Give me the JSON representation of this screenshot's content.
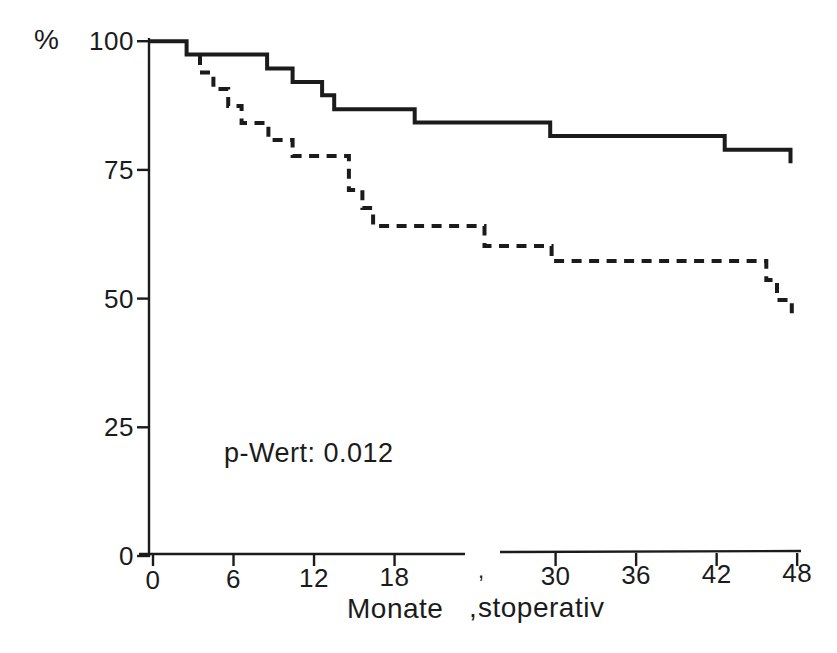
{
  "figure": {
    "background": "#ffffff",
    "ink_color": "#1b1b1b"
  },
  "labels": {
    "y_unit": "%",
    "p_value_annotation": "p-Wert: 0.012",
    "xlabel_part1": "Monate",
    "xlabel_part2": "stoperativ",
    "comma_artifact": ","
  },
  "chart_data": {
    "type": "line",
    "subtype": "kaplan-meier-step-curves",
    "title": "",
    "xlabel": "Monate ,stoperativ",
    "ylabel": "%",
    "annotation": "p-Wert: 0.012",
    "xlim": [
      0,
      48
    ],
    "ylim": [
      0,
      100
    ],
    "grid": false,
    "legend": "none",
    "x_ticks_months": [
      0,
      6,
      12,
      18,
      30,
      36,
      42,
      48
    ],
    "x_ticks_labels": [
      "0",
      "6",
      "12",
      "18",
      "30",
      "36",
      "42",
      "48"
    ],
    "y_ticks_values": [
      0,
      25,
      50,
      75,
      100
    ],
    "y_ticks_labels": [
      "0",
      "25",
      "50",
      "75",
      "100"
    ],
    "series": [
      {
        "name": "solid-curve",
        "line_style": "solid",
        "start_x": 0,
        "start_y": 100,
        "steps": [
          [
            2.5,
            97.4
          ],
          [
            8.5,
            94.7
          ],
          [
            10.4,
            92.1
          ],
          [
            12.6,
            89.5
          ],
          [
            13.5,
            86.8
          ],
          [
            19.5,
            84.2
          ],
          [
            29.6,
            81.6
          ],
          [
            42.6,
            78.9
          ],
          [
            47.5,
            76.3
          ]
        ]
      },
      {
        "name": "dashed-curve",
        "line_style": "dashed",
        "start_x": 3.5,
        "start_y": 97.3,
        "steps": [
          [
            3.5,
            93.9
          ],
          [
            4.5,
            90.7
          ],
          [
            5.6,
            87.4
          ],
          [
            6.6,
            84.1
          ],
          [
            8.6,
            80.8
          ],
          [
            10.4,
            77.7
          ],
          [
            14.6,
            71.1
          ],
          [
            15.6,
            67.6
          ],
          [
            16.4,
            64.1
          ],
          [
            24.7,
            60.2
          ],
          [
            29.7,
            57.3
          ],
          [
            45.7,
            53.6
          ],
          [
            46.5,
            49.7
          ],
          [
            47.6,
            46.4
          ]
        ]
      }
    ]
  }
}
